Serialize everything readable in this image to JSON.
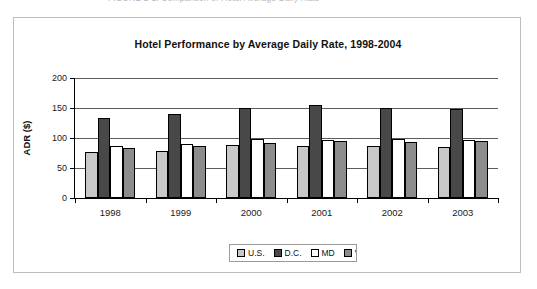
{
  "caption": {
    "text": "FIGURE 2-1. Comparison of Hotel Average Daily Rate"
  },
  "chart_data": {
    "type": "bar",
    "title": "Hotel Performance by Average Daily Rate, 1998-2004",
    "xlabel": "",
    "ylabel": "ADR ($)",
    "categories": [
      "1998",
      "1999",
      "2000",
      "2001",
      "2002",
      "2003"
    ],
    "series": [
      {
        "name": "U.S.",
        "color": "#c8c8c8",
        "values": [
          76,
          79,
          88,
          87,
          86,
          85
        ]
      },
      {
        "name": "D.C.",
        "color": "#484848",
        "values": [
          133,
          140,
          150,
          155,
          150,
          148
        ]
      },
      {
        "name": "MD",
        "color": "#ffffff",
        "values": [
          86,
          90,
          98,
          97,
          98,
          97
        ]
      },
      {
        "name": "VA",
        "color": "#8c8c8c",
        "values": [
          83,
          87,
          92,
          95,
          93,
          95
        ]
      }
    ],
    "ylim": [
      0,
      200
    ],
    "yticks": [
      "0",
      "50",
      "100",
      "150",
      "200"
    ],
    "ytick_values": [
      0,
      50,
      100,
      150,
      200
    ],
    "grid": true,
    "legend_position": "bottom"
  }
}
